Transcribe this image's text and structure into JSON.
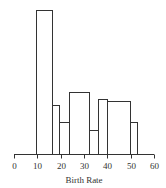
{
  "chart_data": {
    "type": "bar",
    "subtype": "histogram (unequal bin widths)",
    "title": "",
    "xlabel": "Birth Rate",
    "ylabel": "",
    "xlim": [
      0,
      60
    ],
    "xticks": [
      0,
      10,
      20,
      30,
      40,
      50,
      60
    ],
    "y_axis_shown": false,
    "grid": false,
    "legend": null,
    "bins": [
      {
        "x0": 9.4,
        "x1": 16.3,
        "height": 144
      },
      {
        "x0": 16.3,
        "x1": 19.3,
        "height": 49
      },
      {
        "x0": 19.3,
        "x1": 23.6,
        "height": 32
      },
      {
        "x0": 23.6,
        "x1": 32.1,
        "height": 62
      },
      {
        "x0": 32.1,
        "x1": 36.0,
        "height": 24
      },
      {
        "x0": 36.0,
        "x1": 39.9,
        "height": 55
      },
      {
        "x0": 39.9,
        "x1": 49.7,
        "height": 53
      },
      {
        "x0": 49.7,
        "x1": 52.7,
        "height": 32
      }
    ],
    "note": "heights are relative (density-like), read in pixel units from baseline; no y-axis labels shown"
  },
  "axis": {
    "tick_labels": [
      "0",
      "10",
      "20",
      "30",
      "40",
      "50",
      "60"
    ],
    "title": "Birth Rate"
  }
}
